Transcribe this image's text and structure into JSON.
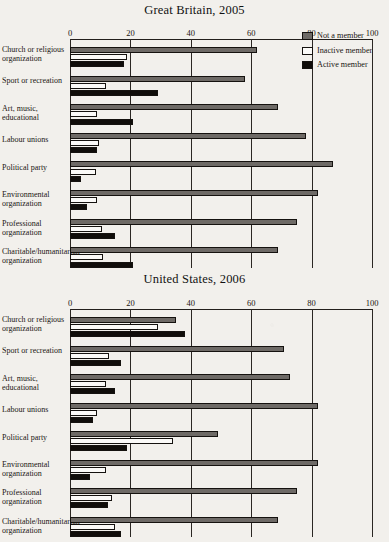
{
  "legend": {
    "items": [
      {
        "label": "Not a member",
        "color": "#6e6a66",
        "key": "not_member"
      },
      {
        "label": "Inactive member",
        "color": "#fbfaf8",
        "key": "inactive"
      },
      {
        "label": "Active member",
        "color": "#100d0a",
        "key": "active"
      }
    ]
  },
  "chart_data": [
    {
      "type": "bar",
      "title": "Great Britain, 2005",
      "orientation": "horizontal",
      "xlabel": "",
      "ylabel": "",
      "xlim": [
        0,
        100
      ],
      "xticks": [
        0,
        20,
        40,
        60,
        80,
        100
      ],
      "grid": true,
      "legend_position": "top-right",
      "categories": [
        "Church or religious organization",
        "Sport or recreation",
        "Art, music, educational",
        "Labour unions",
        "Political party",
        "Environmental organization",
        "Professional organization",
        "Charitable/humanitarian organization"
      ],
      "series": [
        {
          "name": "Not a member",
          "values": [
            62,
            58,
            69,
            78,
            87,
            82,
            75,
            69
          ]
        },
        {
          "name": "Inactive member",
          "values": [
            19,
            12,
            9,
            9.5,
            8.5,
            9,
            10.5,
            11
          ]
        },
        {
          "name": "Active member",
          "values": [
            18,
            29,
            21,
            9,
            3.5,
            5.5,
            15,
            21
          ]
        }
      ]
    },
    {
      "type": "bar",
      "title": "United States, 2006",
      "orientation": "horizontal",
      "xlabel": "",
      "ylabel": "",
      "xlim": [
        0,
        100
      ],
      "xticks": [
        0,
        20,
        40,
        60,
        80,
        100
      ],
      "grid": true,
      "legend_position": "none",
      "categories": [
        "Church or religious organization",
        "Sport or recreation",
        "Art, music, educational",
        "Labour unions",
        "Political party",
        "Environmental organization",
        "Professional organization",
        "Charitable/humanitarian organization"
      ],
      "series": [
        {
          "name": "Not a member",
          "values": [
            35,
            71,
            73,
            82,
            49,
            82,
            75,
            69
          ]
        },
        {
          "name": "Inactive member",
          "values": [
            29,
            13,
            12,
            9,
            34,
            12,
            14,
            15
          ]
        },
        {
          "name": "Active member",
          "values": [
            38,
            17,
            15,
            7.5,
            19,
            6.5,
            12.5,
            17
          ]
        }
      ]
    }
  ]
}
